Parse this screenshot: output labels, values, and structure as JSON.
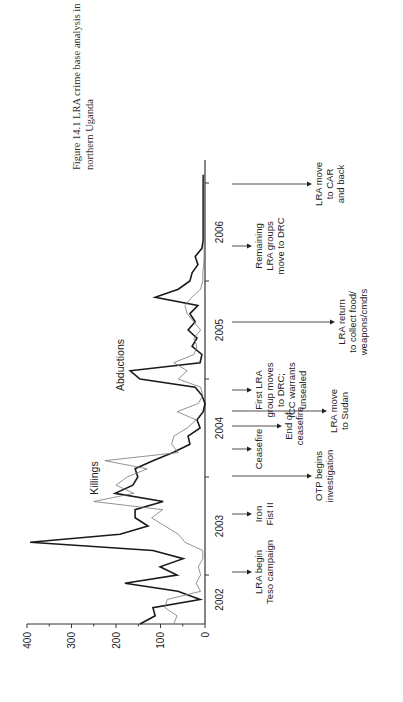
{
  "chart_data": {
    "type": "line",
    "title_lines": [
      "Figure 14.1  LRA crime base analysis in",
      "northern Uganda"
    ],
    "orientation": "rotated-90-ccw",
    "xlabel": "",
    "ylabel": "",
    "ylim": [
      0,
      400
    ],
    "y_ticks": [
      "0",
      "100",
      "200",
      "300",
      "400"
    ],
    "x_range": [
      "2002-07",
      "2007-02"
    ],
    "x_tick_labels": [
      "2002",
      "2003",
      "2004",
      "2005",
      "2006"
    ],
    "grid": false,
    "x": [
      "2002-07",
      "2002-08",
      "2002-09",
      "2002-10",
      "2002-11",
      "2002-12",
      "2003-01",
      "2003-02",
      "2003-03",
      "2003-04",
      "2003-05",
      "2003-06",
      "2003-07",
      "2003-08",
      "2003-09",
      "2003-10",
      "2003-11",
      "2003-12",
      "2004-01",
      "2004-02",
      "2004-03",
      "2004-04",
      "2004-05",
      "2004-06",
      "2004-07",
      "2004-08",
      "2004-09",
      "2004-10",
      "2004-11",
      "2004-12",
      "2005-01",
      "2005-02",
      "2005-03",
      "2005-04",
      "2005-05",
      "2005-06",
      "2005-07",
      "2005-08",
      "2005-09",
      "2005-10",
      "2005-11",
      "2005-12",
      "2006-01",
      "2006-02",
      "2006-03",
      "2006-04",
      "2006-05",
      "2006-06",
      "2006-07",
      "2006-08",
      "2006-09",
      "2006-10",
      "2006-11",
      "2006-12",
      "2007-01",
      "2007-02"
    ],
    "series": [
      {
        "name": "Abductions",
        "style": "thick",
        "color": "#1a1a1a",
        "values": [
          146,
          112,
          117,
          11,
          61,
          180,
          63,
          101,
          49,
          117,
          393,
          191,
          128,
          157,
          157,
          94,
          202,
          162,
          151,
          157,
          117,
          72,
          34,
          38,
          11,
          18,
          4,
          0,
          7,
          22,
          146,
          168,
          11,
          7,
          29,
          18,
          38,
          22,
          34,
          16,
          112,
          60,
          34,
          29,
          16,
          22,
          7,
          4,
          4,
          4,
          4,
          4,
          4,
          4,
          4,
          4
        ]
      },
      {
        "name": "Killings",
        "style": "thin",
        "color": "#777777",
        "values": [
          70,
          63,
          90,
          85,
          10,
          20,
          10,
          15,
          5,
          5,
          45,
          60,
          90,
          120,
          95,
          250,
          160,
          200,
          175,
          130,
          225,
          60,
          75,
          70,
          40,
          20,
          63,
          15,
          5,
          10,
          60,
          40,
          70,
          25,
          18,
          25,
          10,
          25,
          40,
          45,
          30,
          10,
          5,
          5,
          3,
          2,
          2,
          2,
          2,
          2,
          2,
          2,
          2,
          2,
          2,
          2
        ]
      }
    ],
    "series_labels": [
      {
        "text": "Killings",
        "series": "Killings"
      },
      {
        "text": "Abductions",
        "series": "Abductions"
      }
    ],
    "annotations": [
      {
        "lines": [
          "LRA begin",
          "Teso campaign"
        ],
        "date": "2003-06",
        "arrow": "short"
      },
      {
        "lines": [
          "Iron",
          "Fist II"
        ],
        "date": "2004-02",
        "arrow": "short"
      },
      {
        "lines": [
          "OTP begins",
          "investigation"
        ],
        "date": "2004-07",
        "arrow": "long"
      },
      {
        "lines": [
          "Ceasefire"
        ],
        "date": "2004-11",
        "arrow": "short"
      },
      {
        "lines": [
          "End of",
          "ceasefire"
        ],
        "date": "2005-01",
        "arrow": "medium"
      },
      {
        "lines": [
          "LRA move",
          "to Sudan"
        ],
        "date": "2005-03",
        "arrow": "longer"
      },
      {
        "lines": [
          "First LRA",
          "group moves",
          "to DRC;",
          "ICC warrants",
          "unsealed"
        ],
        "date": "2005-06",
        "arrow": "short"
      },
      {
        "lines": [
          "LRA return",
          "to collect food/",
          "weapons/cmdrs"
        ],
        "date": "2005-11",
        "arrow": "longest"
      },
      {
        "lines": [
          "Remaining",
          "LRA groups",
          "move to DRC"
        ],
        "date": "2006-06",
        "arrow": "short"
      },
      {
        "lines": [
          "LRA move",
          "to CAR",
          "and back"
        ],
        "date": "2007-01",
        "arrow": "long"
      }
    ]
  }
}
